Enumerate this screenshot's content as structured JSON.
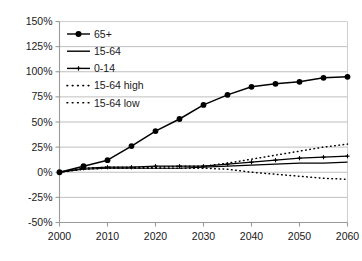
{
  "chart_data": {
    "type": "line",
    "title": "",
    "subtitle": "",
    "xlabel": "",
    "ylabel": "",
    "xlim": [
      2000,
      2060
    ],
    "ylim": [
      -50,
      150
    ],
    "yticks": [
      -50,
      -25,
      0,
      25,
      50,
      75,
      100,
      125,
      150
    ],
    "ytick_labels": [
      "-50%",
      "-25%",
      "0%",
      "25%",
      "50%",
      "75%",
      "100%",
      "125%",
      "150%"
    ],
    "xticks": [
      2000,
      2010,
      2020,
      2030,
      2040,
      2050,
      2060
    ],
    "xtick_labels": [
      "2000",
      "2010",
      "2020",
      "2030",
      "2040",
      "2050",
      "2060"
    ],
    "grid": "horizontal",
    "legend_position": "upper-left",
    "x": [
      2000,
      2005,
      2010,
      2015,
      2020,
      2025,
      2030,
      2035,
      2040,
      2045,
      2050,
      2055,
      2060
    ],
    "series": [
      {
        "name": "65+",
        "marker": "filled-circle",
        "line_style": "solid",
        "color": "#000000",
        "values": [
          0,
          6,
          12,
          26,
          41,
          53,
          67,
          77,
          85,
          88,
          90,
          94,
          95
        ]
      },
      {
        "name": "15-64",
        "marker": "none",
        "line_style": "solid",
        "color": "#000000",
        "values": [
          0,
          3,
          4,
          4,
          4,
          4,
          5,
          6,
          7,
          8,
          9,
          9,
          10
        ]
      },
      {
        "name": "0-14",
        "marker": "small-plus",
        "line_style": "solid",
        "color": "#000000",
        "values": [
          0,
          4,
          5,
          5,
          6,
          6,
          6,
          8,
          10,
          12,
          14,
          15,
          16
        ]
      },
      {
        "name": "15-64 high",
        "marker": "none",
        "line_style": "dotted",
        "color": "#000000",
        "values": [
          0,
          4,
          5,
          5,
          5,
          6,
          6,
          9,
          13,
          17,
          21,
          25,
          28
        ]
      },
      {
        "name": "15-64 low",
        "marker": "none",
        "line_style": "dotted",
        "color": "#000000",
        "values": [
          0,
          3,
          4,
          4,
          4,
          4,
          4,
          3,
          0,
          -2,
          -4,
          -6,
          -7
        ]
      }
    ],
    "legend": [
      {
        "label": "65+",
        "marker": "filled-circle",
        "line_style": "solid"
      },
      {
        "label": "15-64",
        "marker": "none",
        "line_style": "solid"
      },
      {
        "label": "0-14",
        "marker": "small-plus",
        "line_style": "solid"
      },
      {
        "label": "15-64 high",
        "marker": "none",
        "line_style": "dotted"
      },
      {
        "label": "15-64 low",
        "marker": "none",
        "line_style": "dotted"
      }
    ],
    "colors": {
      "axis": "#9a9a9a",
      "grid": "#b8b8b8",
      "series": "#000000",
      "text": "#1a1a1a",
      "background": "#ffffff"
    }
  }
}
